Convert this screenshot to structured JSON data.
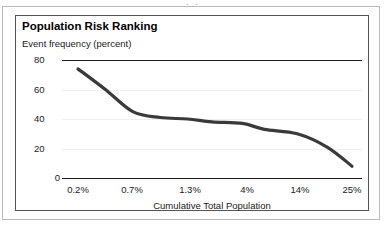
{
  "figure": {
    "caption_remnant": "·                                                  ·",
    "frame_color": "#b9b9b9",
    "inner_border_color": "#555555"
  },
  "chart_data": {
    "type": "line",
    "title": "Population Risk Ranking",
    "xlabel": "Cumulative Total Population",
    "ylabel": "Event frequency (percent)",
    "categories": [
      "0.2%",
      "0.7%",
      "1.3%",
      "4%",
      "14%",
      "25%"
    ],
    "values": [
      74,
      45,
      40,
      37,
      30,
      8
    ],
    "detailed_points": [
      {
        "x": "0.2%",
        "y": 74
      },
      {
        "x": "0.45%",
        "y": 60
      },
      {
        "x": "0.7%",
        "y": 45
      },
      {
        "x": "1.0%",
        "y": 41
      },
      {
        "x": "1.3%",
        "y": 40
      },
      {
        "x": "2.5%",
        "y": 38
      },
      {
        "x": "4%",
        "y": 37
      },
      {
        "x": "8%",
        "y": 33
      },
      {
        "x": "14%",
        "y": 30
      },
      {
        "x": "20%",
        "y": 21
      },
      {
        "x": "25%",
        "y": 8
      }
    ],
    "yticks": [
      80,
      60,
      40,
      20,
      0
    ],
    "ylim": [
      0,
      80
    ],
    "grid": true,
    "legend": "none",
    "series_color": "#3a3a3a",
    "series_width": 3,
    "axis_line_color": "#1c1c1c",
    "gridline_color": "#f0f0f0"
  }
}
